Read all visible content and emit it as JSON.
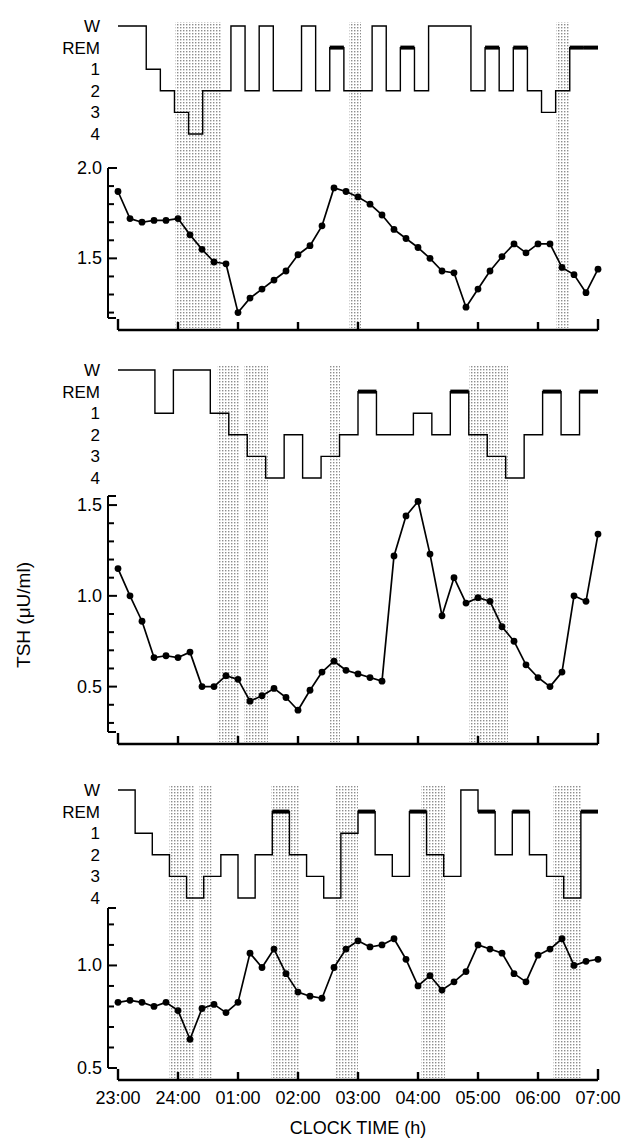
{
  "figure": {
    "type": "multi-panel-timeseries",
    "n_panels": 3
  },
  "axes": {
    "xlabel": "CLOCK TIME (h)",
    "ylabel": "TSH (μU/ml)",
    "x_ticks": [
      "23:00",
      "24:00",
      "01:00",
      "02:00",
      "03:00",
      "04:00",
      "05:00",
      "06:00",
      "07:00"
    ],
    "x_range_hours": [
      23,
      31
    ],
    "sleep_stage_labels": [
      "W",
      "REM",
      "1",
      "2",
      "3",
      "4"
    ]
  },
  "style": {
    "line_color": "#000000",
    "marker_color": "#000000",
    "sws_band_fill": "#c9c9c9",
    "background": "#ffffff"
  },
  "chart_data": [
    {
      "type": "line",
      "panel": 1,
      "title": "",
      "xlabel": "",
      "ylabel": "TSH (μU/ml)",
      "ylim": [
        1.17,
        2.0
      ],
      "y_ticks": [
        1.5,
        2.0
      ],
      "y_minor_step": 0.1,
      "grid": false,
      "legend": "none",
      "x": [
        23.0,
        23.2,
        23.4,
        23.6,
        23.8,
        24.0,
        24.2,
        24.4,
        24.6,
        24.8,
        25.0,
        25.2,
        25.4,
        25.6,
        25.8,
        26.0,
        26.2,
        26.4,
        26.6,
        26.8,
        27.0,
        27.2,
        27.4,
        27.6,
        27.8,
        28.0,
        28.2,
        28.4,
        28.6,
        28.8,
        29.0,
        29.2,
        29.4,
        29.6,
        29.8,
        30.0,
        30.2,
        30.4,
        30.6,
        30.8,
        31.0
      ],
      "values": [
        1.87,
        1.72,
        1.7,
        1.71,
        1.71,
        1.72,
        1.63,
        1.55,
        1.48,
        1.47,
        1.2,
        1.28,
        1.33,
        1.38,
        1.43,
        1.52,
        1.57,
        1.68,
        1.89,
        1.87,
        1.84,
        1.8,
        1.74,
        1.66,
        1.61,
        1.56,
        1.5,
        1.43,
        1.42,
        1.23,
        1.33,
        1.43,
        1.51,
        1.58,
        1.53,
        1.58,
        1.58,
        1.45,
        1.41,
        1.31,
        1.44
      ],
      "sws_bands": [
        [
          23.95,
          24.72
        ],
        [
          26.85,
          27.05
        ],
        [
          30.3,
          30.52
        ]
      ],
      "hypnogram": {
        "stages": [
          "W",
          "W",
          "1",
          "2",
          "3",
          "4",
          "2",
          "2",
          "W",
          "2",
          "W",
          "2",
          "2",
          "W",
          "2",
          "REM",
          "2",
          "2",
          "W",
          "2",
          "REM",
          "2",
          "W",
          "W",
          "W",
          "2",
          "REM",
          "2",
          "REM",
          "2",
          "3",
          "2",
          "REM",
          "REM"
        ]
      }
    },
    {
      "type": "line",
      "panel": 2,
      "title": "",
      "xlabel": "",
      "ylabel": "TSH (μU/ml)",
      "ylim": [
        0.25,
        1.55
      ],
      "y_ticks": [
        0.5,
        1.0,
        1.5
      ],
      "y_minor_step": 0.1,
      "grid": false,
      "legend": "none",
      "x": [
        23.0,
        23.2,
        23.4,
        23.6,
        23.8,
        24.0,
        24.2,
        24.4,
        24.6,
        24.8,
        25.0,
        25.2,
        25.4,
        25.6,
        25.8,
        26.0,
        26.2,
        26.4,
        26.6,
        26.8,
        27.0,
        27.2,
        27.4,
        27.6,
        27.8,
        28.0,
        28.2,
        28.4,
        28.6,
        28.8,
        29.0,
        29.2,
        29.4,
        29.6,
        29.8,
        30.0,
        30.2,
        30.4,
        30.6,
        30.8,
        31.0
      ],
      "values": [
        1.15,
        1.0,
        0.86,
        0.66,
        0.67,
        0.66,
        0.69,
        0.5,
        0.5,
        0.56,
        0.54,
        0.42,
        0.45,
        0.49,
        0.44,
        0.37,
        0.48,
        0.58,
        0.64,
        0.59,
        0.57,
        0.55,
        0.53,
        1.22,
        1.44,
        1.52,
        1.23,
        0.89,
        1.1,
        0.96,
        0.99,
        0.97,
        0.83,
        0.75,
        0.62,
        0.55,
        0.5,
        0.58,
        1.0,
        0.97,
        1.34
      ],
      "sws_bands": [
        [
          24.66,
          25.02
        ],
        [
          25.1,
          25.5
        ],
        [
          26.52,
          26.7
        ],
        [
          28.85,
          29.5
        ]
      ],
      "hypnogram": {
        "stages": [
          "W",
          "W",
          "1",
          "W",
          "W",
          "1",
          "2",
          "3",
          "4",
          "2",
          "4",
          "3",
          "2",
          "REM",
          "2",
          "2",
          "1",
          "2",
          "REM",
          "2",
          "3",
          "4",
          "2",
          "REM",
          "2",
          "REM"
        ]
      }
    },
    {
      "type": "line",
      "panel": 3,
      "title": "",
      "xlabel": "CLOCK TIME (h)",
      "ylabel": "TSH (μU/ml)",
      "ylim": [
        0.5,
        1.28
      ],
      "y_ticks": [
        0.5,
        1.0
      ],
      "y_minor_step": 0.1,
      "grid": false,
      "legend": "none",
      "x": [
        23.0,
        23.2,
        23.4,
        23.6,
        23.8,
        24.0,
        24.2,
        24.4,
        24.6,
        24.8,
        25.0,
        25.2,
        25.4,
        25.6,
        25.8,
        26.0,
        26.2,
        26.4,
        26.6,
        26.8,
        27.0,
        27.2,
        27.4,
        27.6,
        27.8,
        28.0,
        28.2,
        28.4,
        28.6,
        28.8,
        29.0,
        29.2,
        29.4,
        29.6,
        29.8,
        30.0,
        30.2,
        30.4,
        30.6,
        30.8,
        31.0
      ],
      "values": [
        0.82,
        0.83,
        0.82,
        0.8,
        0.82,
        0.78,
        0.64,
        0.79,
        0.81,
        0.77,
        0.82,
        1.06,
        0.99,
        1.08,
        0.96,
        0.87,
        0.85,
        0.84,
        0.99,
        1.08,
        1.12,
        1.09,
        1.1,
        1.13,
        1.03,
        0.9,
        0.95,
        0.88,
        0.92,
        0.97,
        1.1,
        1.08,
        1.06,
        0.96,
        0.92,
        1.05,
        1.08,
        1.13,
        1.0,
        1.02,
        1.03
      ],
      "sws_bands": [
        [
          23.85,
          24.28
        ],
        [
          24.35,
          24.56
        ],
        [
          25.55,
          26.02
        ],
        [
          26.62,
          27.0
        ],
        [
          28.05,
          28.45
        ],
        [
          30.25,
          30.72
        ]
      ],
      "hypnogram": {
        "stages": [
          "W",
          "1",
          "2",
          "3",
          "4",
          "3",
          "2",
          "4",
          "2",
          "REM",
          "2",
          "3",
          "4",
          "1",
          "REM",
          "2",
          "3",
          "REM",
          "2",
          "3",
          "W",
          "REM",
          "2",
          "REM",
          "2",
          "3",
          "4",
          "REM"
        ]
      }
    }
  ]
}
